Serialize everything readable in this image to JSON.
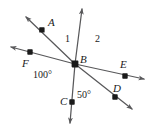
{
  "figure": {
    "kind": "geometry-diagram",
    "width": 155,
    "height": 134,
    "background_color": "#ffffff",
    "line_color": "#58585a",
    "dot_color": "#1a1a1a",
    "text_color": "#1a1a1a"
  },
  "vertex": {
    "name": "B",
    "label": "B",
    "x": 75,
    "y": 64,
    "label_x": 80,
    "label_y": 55
  },
  "points": [
    {
      "name": "A",
      "label": "A",
      "x": 42,
      "y": 30,
      "label_x": 48,
      "label_y": 18
    },
    {
      "name": "F",
      "label": "F",
      "x": 30,
      "y": 52,
      "label_x": 23,
      "label_y": 59
    },
    {
      "name": "E",
      "label": "E",
      "x": 125,
      "y": 76,
      "label_x": 120,
      "label_y": 60
    },
    {
      "name": "D",
      "label": "D",
      "x": 115,
      "y": 97,
      "label_x": 113,
      "label_y": 84
    },
    {
      "name": "C",
      "label": "C",
      "x": 72,
      "y": 102,
      "label_x": 61,
      "label_y": 101
    }
  ],
  "rays": [
    {
      "name": "ray-BA",
      "from": "B",
      "toward": "A",
      "tip_x": 23,
      "tip_y": 14,
      "arrow": true
    },
    {
      "name": "ray-BD",
      "from": "B",
      "toward": "D",
      "tip_x": 135,
      "tip_y": 112,
      "arrow": true
    },
    {
      "name": "ray-BF",
      "from": "B",
      "toward": "F",
      "tip_x": 7,
      "tip_y": 46,
      "arrow": true
    },
    {
      "name": "ray-BE",
      "from": "B",
      "toward": "E",
      "tip_x": 147,
      "tip_y": 80,
      "arrow": true
    },
    {
      "name": "ray-B-up",
      "from": "B",
      "toward": "up",
      "tip_x": 83,
      "tip_y": 5,
      "arrow": true
    },
    {
      "name": "ray-BC",
      "from": "B",
      "toward": "C",
      "tip_x": 70,
      "tip_y": 127,
      "arrow": true
    }
  ],
  "angle_labels": [
    {
      "name": "angle-1",
      "text": "1",
      "x": 65,
      "y": 34
    },
    {
      "name": "angle-2",
      "text": "2",
      "x": 95,
      "y": 34
    },
    {
      "name": "angle-100",
      "text": "100°",
      "x": 33,
      "y": 69
    },
    {
      "name": "angle-50",
      "text": "50°",
      "x": 76,
      "y": 90
    }
  ]
}
